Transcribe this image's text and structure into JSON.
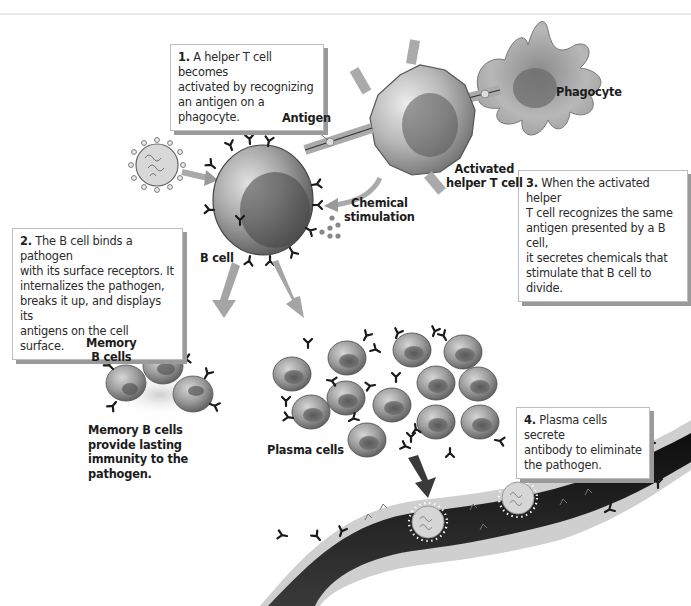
{
  "figure": {
    "steps": [
      {
        "number": "1.",
        "text_lines": [
          "A helper T cell becomes",
          "activated by recognizing",
          "an antigen on a phagocyte."
        ]
      },
      {
        "number": "2.",
        "text_lines": [
          "The B cell binds a pathogen",
          "with its surface receptors.  It",
          "internalizes the pathogen,",
          "breaks it up, and displays its",
          "antigens on the cell surface."
        ]
      },
      {
        "number": "3.",
        "text_lines": [
          "When the activated helper",
          "T cell recognizes the same",
          "antigen presented by a B cell,",
          "it secretes chemicals that",
          "stimulate that B cell to divide."
        ]
      },
      {
        "number": "4.",
        "text_lines": [
          "Plasma cells secrete",
          "antibody to eliminate",
          "the pathogen."
        ]
      }
    ],
    "labels": {
      "phagocyte": "Phagocyte",
      "antigen": "Antigen",
      "activated_t_cell_line1": "Activated",
      "activated_t_cell_line2": "helper T cell",
      "chemical_line1": "Chemical",
      "chemical_line2": "stimulation",
      "b_cell": "B cell",
      "memory_line1": "Memory",
      "memory_line2": "B cells",
      "plasma_cells": "Plasma cells",
      "memory_desc": [
        "Memory B cells",
        "provide lasting",
        "immunity to the",
        "pathogen."
      ]
    },
    "colors": {
      "background": "#ffffff",
      "callout_border": "#bdbdbd",
      "callout_shadow": "#9a9a9a",
      "cell_fill": "#8a8a8a",
      "vessel_dark": "#1a1a1a",
      "arrow": "#9c9c9c"
    }
  }
}
